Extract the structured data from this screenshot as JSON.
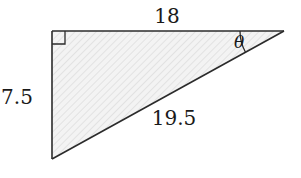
{
  "diagram": {
    "type": "right-triangle",
    "colors": {
      "stroke": "#2b2b2b",
      "fill": "#f3f3f3",
      "hatch": "#dedede",
      "text": "#1a1a1a"
    },
    "vertices": {
      "right_angle": [
        52,
        31
      ],
      "acute_theta": [
        284,
        31
      ],
      "bottom": [
        52,
        159
      ]
    },
    "labels": {
      "top_side": "18",
      "left_side": "7.5",
      "hypotenuse": "19.5",
      "angle": "θ"
    },
    "markers": {
      "right_angle_square": true,
      "angle_arc_at": "acute_theta"
    }
  }
}
